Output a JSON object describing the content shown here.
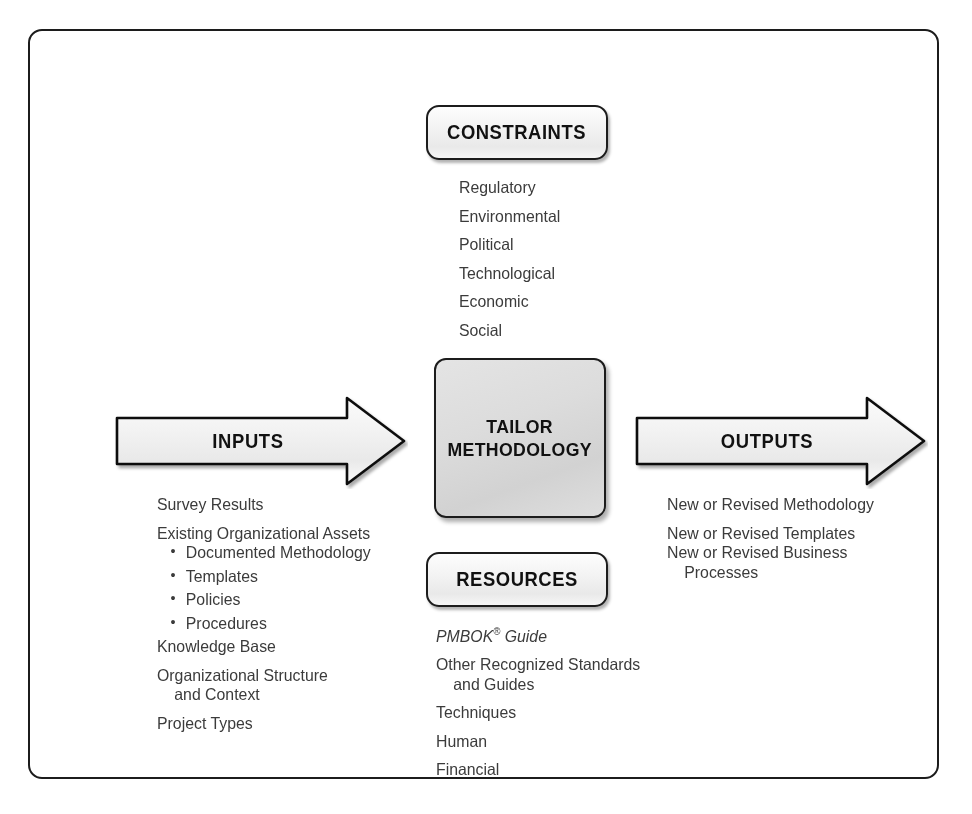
{
  "diagram": {
    "accent_color": "#1c1c1c",
    "text_color": "#3b3b3b",
    "center_fill": "#d8d8d8"
  },
  "constraints": {
    "box_label": "CONSTRAINTS",
    "items": [
      "Regulatory",
      "Environmental",
      "Political",
      "Technological",
      "Economic",
      "Social"
    ]
  },
  "center": {
    "label": "TAILOR\nMETHODOLOGY"
  },
  "inputs": {
    "arrow_label": "INPUTS",
    "items": [
      {
        "text": "Survey Results",
        "kind": "top"
      },
      {
        "text": "Existing Organizational Assets",
        "kind": "top"
      },
      {
        "text": "Documented Methodology",
        "kind": "bullet"
      },
      {
        "text": "Templates",
        "kind": "bullet"
      },
      {
        "text": "Policies",
        "kind": "bullet"
      },
      {
        "text": "Procedures",
        "kind": "bullet"
      },
      {
        "text": "Knowledge Base",
        "kind": "top"
      },
      {
        "text": "Organizational Structure",
        "kind": "top-tight"
      },
      {
        "text": "and Context",
        "kind": "continuation"
      },
      {
        "text": "Project Types",
        "kind": "top"
      }
    ]
  },
  "outputs": {
    "arrow_label": "OUTPUTS",
    "items": [
      {
        "text": "New or Revised Methodology",
        "kind": "top"
      },
      {
        "text": "New or Revised Templates",
        "kind": "top"
      },
      {
        "text": "New or Revised Business",
        "kind": "top-tight"
      },
      {
        "text": "Processes",
        "kind": "continuation"
      }
    ]
  },
  "resources": {
    "box_label": "RESOURCES",
    "items": [
      {
        "text": "PMBOK",
        "suffix": " Guide",
        "registered": "®",
        "kind": "italic"
      },
      {
        "text": "Other Recognized Standards",
        "kind": "top-tight"
      },
      {
        "text": "and Guides",
        "kind": "continuation"
      },
      {
        "text": "Techniques",
        "kind": "top"
      },
      {
        "text": "Human",
        "kind": "top"
      },
      {
        "text": "Financial",
        "kind": "top"
      }
    ]
  }
}
